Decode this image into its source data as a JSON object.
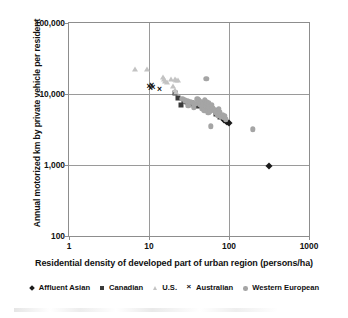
{
  "chart_data": {
    "type": "scatter",
    "title": "",
    "xlabel": "Residential density of developed part of urban region (persons/ha)",
    "ylabel": "Annual motorized km by private vehicle per resident",
    "xscale": "log",
    "yscale": "log",
    "xlim": [
      1,
      1000
    ],
    "ylim": [
      100,
      100000
    ],
    "xticks": [
      "1",
      "10",
      "100",
      "1000"
    ],
    "xtick_values": [
      1,
      10,
      100,
      1000
    ],
    "yticks": [
      "100",
      "1,000",
      "10,000",
      "100,000"
    ],
    "ytick_values": [
      100,
      1000,
      10000,
      100000
    ],
    "grid": true,
    "legend_position": "bottom",
    "series": [
      {
        "name": "Affluent Asian",
        "marker": "diamond",
        "color": "#1b1b1b",
        "points": [
          [
            86,
            4300
          ],
          [
            91,
            4150
          ],
          [
            95,
            4000
          ],
          [
            99,
            3950
          ],
          [
            320,
            980
          ]
        ]
      },
      {
        "name": "Canadian",
        "marker": "square",
        "color": "#3a3a3a",
        "points": [
          [
            21,
            10300
          ],
          [
            23,
            8700
          ],
          [
            25,
            7000
          ],
          [
            27,
            7950
          ],
          [
            30,
            7600
          ],
          [
            34,
            7350
          ],
          [
            37,
            7100
          ],
          [
            41,
            6700
          ],
          [
            55,
            6200
          ],
          [
            68,
            5200
          ],
          [
            78,
            4700
          ]
        ]
      },
      {
        "name": "U.S.",
        "marker": "triangle",
        "color": "#c3c3c3",
        "points": [
          [
            6.6,
            22500
          ],
          [
            9.5,
            22800
          ],
          [
            15,
            17500
          ],
          [
            15.5,
            16400
          ],
          [
            16,
            15200
          ],
          [
            17,
            14600
          ],
          [
            19,
            16200
          ],
          [
            21,
            16100
          ],
          [
            22,
            16000
          ],
          [
            23,
            15900
          ],
          [
            20,
            12800
          ],
          [
            21,
            11500
          ],
          [
            22,
            10800
          ]
        ]
      },
      {
        "name": "Australian",
        "marker": "x",
        "color": "#111111",
        "points": [
          [
            10,
            12800
          ],
          [
            10.4,
            12300
          ],
          [
            10.8,
            13400
          ],
          [
            11.2,
            12600
          ],
          [
            13.5,
            11800
          ],
          [
            72,
            6000
          ]
        ]
      },
      {
        "name": "Western European",
        "marker": "circle",
        "color": "#a5a5a5",
        "points": [
          [
            26,
            8500
          ],
          [
            28,
            8200
          ],
          [
            30,
            7900
          ],
          [
            31,
            6800
          ],
          [
            33,
            7700
          ],
          [
            35,
            7500
          ],
          [
            36,
            6500
          ],
          [
            38,
            7300
          ],
          [
            40,
            8400
          ],
          [
            42,
            8100
          ],
          [
            43,
            7000
          ],
          [
            45,
            7800
          ],
          [
            46,
            6300
          ],
          [
            48,
            7200
          ],
          [
            49,
            5900
          ],
          [
            50,
            8300
          ],
          [
            51,
            6900
          ],
          [
            52,
            16300
          ],
          [
            53,
            7600
          ],
          [
            54,
            6100
          ],
          [
            55,
            5400
          ],
          [
            56,
            7400
          ],
          [
            57,
            6600
          ],
          [
            58,
            5700
          ],
          [
            59,
            3500
          ],
          [
            61,
            7100
          ],
          [
            63,
            6400
          ],
          [
            65,
            5800
          ],
          [
            67,
            6000
          ],
          [
            69,
            5500
          ],
          [
            71,
            5300
          ],
          [
            73,
            5000
          ],
          [
            75,
            6200
          ],
          [
            77,
            5600
          ],
          [
            80,
            4800
          ],
          [
            83,
            5100
          ],
          [
            86,
            4600
          ],
          [
            89,
            4900
          ],
          [
            92,
            4400
          ],
          [
            200,
            3200
          ]
        ]
      }
    ]
  },
  "legend": {
    "items": [
      {
        "label": "Affluent Asian",
        "marker": "diamond"
      },
      {
        "label": "Canadian",
        "marker": "square"
      },
      {
        "label": "U.S.",
        "marker": "triangle"
      },
      {
        "label": "Australian",
        "marker": "x"
      },
      {
        "label": "Western European",
        "marker": "circle"
      }
    ]
  }
}
